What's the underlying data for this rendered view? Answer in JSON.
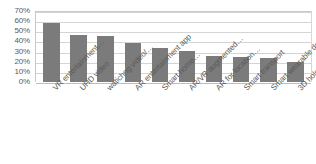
{
  "chart_data": {
    "type": "bar",
    "title": "",
    "subtitle": "",
    "xlabel": "",
    "ylabel": "",
    "grid": true,
    "legend": false,
    "legend_position": "none",
    "orientation": "vertical",
    "bar_color": "#7b7b7b",
    "gridline_color": "#d4d4d4",
    "axis_color": "#c9c9c9",
    "text_color": "#5a5a5a",
    "ylim": [
      0,
      70
    ],
    "ytick_step": 10,
    "ytick_labels": [
      "70%",
      "60%",
      "50%",
      "40%",
      "30%",
      "20%",
      "10%",
      "0%"
    ],
    "ytick_values": [
      70,
      60,
      50,
      40,
      30,
      20,
      10,
      0
    ],
    "categories": [
      "VR entertainment…",
      "UHD video",
      "watichng video/…",
      "AR entertainment app",
      "Smart home…",
      "AR/VR augmented…",
      "AR for location…",
      "Smart transport",
      "Smart wearable device",
      "3D hologram calling"
    ],
    "values": [
      58,
      46,
      45,
      38,
      34,
      31,
      26,
      25,
      24,
      20
    ],
    "value_labels": [
      "58%",
      "46%",
      "45%",
      "38%",
      "34%",
      "31%",
      "26%",
      "25%",
      "24%",
      "20%"
    ],
    "annotations": []
  }
}
